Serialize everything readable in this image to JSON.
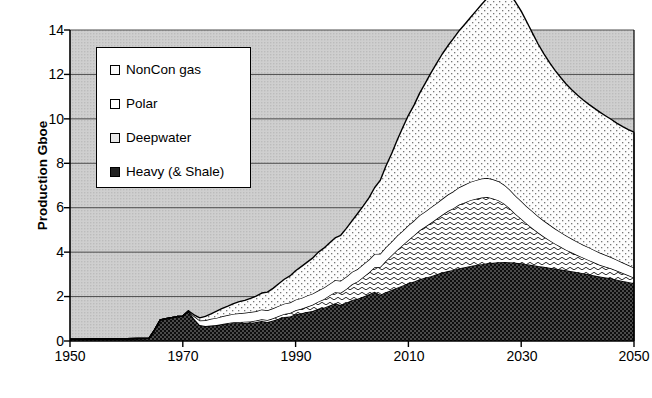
{
  "chart_data": {
    "type": "area",
    "stacked": true,
    "title": "",
    "xlabel": "",
    "ylabel": "Production Gboe",
    "xlim": [
      1950,
      2050
    ],
    "ylim": [
      0,
      14
    ],
    "xticks": [
      1950,
      1970,
      1990,
      2010,
      2030,
      2050
    ],
    "yticks": [
      0,
      2,
      4,
      6,
      8,
      10,
      12,
      14
    ],
    "grid": "horizontal",
    "legend_position": "upper-left-inside",
    "plot_background": "#c9c9c9",
    "x": [
      1950,
      1952,
      1954,
      1956,
      1958,
      1960,
      1962,
      1964,
      1965,
      1966,
      1967,
      1968,
      1969,
      1970,
      1971,
      1972,
      1973,
      1974,
      1975,
      1976,
      1977,
      1978,
      1979,
      1980,
      1981,
      1982,
      1983,
      1984,
      1985,
      1986,
      1987,
      1988,
      1989,
      1990,
      1991,
      1992,
      1993,
      1994,
      1995,
      1996,
      1997,
      1998,
      1999,
      2000,
      2001,
      2002,
      2003,
      2004,
      2005,
      2006,
      2007,
      2008,
      2009,
      2010,
      2011,
      2012,
      2013,
      2014,
      2015,
      2016,
      2017,
      2018,
      2019,
      2020,
      2021,
      2022,
      2023,
      2024,
      2025,
      2026,
      2027,
      2028,
      2029,
      2030,
      2031,
      2032,
      2033,
      2034,
      2035,
      2036,
      2037,
      2038,
      2039,
      2040,
      2041,
      2042,
      2043,
      2044,
      2045,
      2046,
      2047,
      2048,
      2049,
      2050
    ],
    "series": [
      {
        "name": "Heavy (& Shale)",
        "pattern": "dark-checker",
        "color": "#1a1a1a",
        "values": [
          0.08,
          0.08,
          0.09,
          0.09,
          0.1,
          0.1,
          0.11,
          0.12,
          0.5,
          0.95,
          1.0,
          1.05,
          1.1,
          1.12,
          1.35,
          1.0,
          0.72,
          0.68,
          0.7,
          0.72,
          0.75,
          0.78,
          0.8,
          0.8,
          0.82,
          0.82,
          0.85,
          0.9,
          0.85,
          0.92,
          1.0,
          1.08,
          1.1,
          1.2,
          1.25,
          1.3,
          1.35,
          1.45,
          1.5,
          1.6,
          1.7,
          1.62,
          1.72,
          1.85,
          1.9,
          2.0,
          2.1,
          2.22,
          2.08,
          2.2,
          2.3,
          2.4,
          2.5,
          2.6,
          2.68,
          2.78,
          2.85,
          2.92,
          3.0,
          3.08,
          3.15,
          3.2,
          3.28,
          3.32,
          3.38,
          3.42,
          3.46,
          3.5,
          3.52,
          3.55,
          3.56,
          3.55,
          3.52,
          3.5,
          3.46,
          3.42,
          3.38,
          3.34,
          3.3,
          3.26,
          3.22,
          3.18,
          3.14,
          3.1,
          3.05,
          3.0,
          2.95,
          2.9,
          2.86,
          2.82,
          2.76,
          2.7,
          2.66,
          2.6
        ]
      },
      {
        "name": "Deepwater",
        "pattern": "wave",
        "color": "#f2f2f2",
        "values": [
          0.0,
          0.0,
          0.0,
          0.0,
          0.0,
          0.0,
          0.0,
          0.0,
          0.0,
          0.0,
          0.0,
          0.0,
          0.0,
          0.0,
          0.0,
          0.0,
          0.0,
          0.0,
          0.0,
          0.0,
          0.02,
          0.03,
          0.04,
          0.05,
          0.05,
          0.06,
          0.07,
          0.08,
          0.09,
          0.1,
          0.12,
          0.14,
          0.16,
          0.18,
          0.2,
          0.24,
          0.28,
          0.32,
          0.38,
          0.45,
          0.5,
          0.55,
          0.62,
          0.7,
          0.78,
          0.88,
          0.98,
          1.1,
          1.25,
          1.4,
          1.55,
          1.7,
          1.82,
          1.95,
          2.08,
          2.2,
          2.3,
          2.4,
          2.5,
          2.6,
          2.7,
          2.78,
          2.86,
          2.92,
          2.96,
          2.98,
          3.0,
          2.98,
          2.9,
          2.78,
          2.62,
          2.42,
          2.2,
          2.0,
          1.82,
          1.66,
          1.5,
          1.36,
          1.24,
          1.12,
          1.02,
          0.92,
          0.84,
          0.76,
          0.7,
          0.64,
          0.58,
          0.52,
          0.48,
          0.44,
          0.4,
          0.36,
          0.3,
          0.25
        ]
      },
      {
        "name": "Polar",
        "pattern": "plain-white",
        "color": "#ffffff",
        "values": [
          0.0,
          0.0,
          0.0,
          0.0,
          0.0,
          0.0,
          0.0,
          0.0,
          0.0,
          0.0,
          0.0,
          0.0,
          0.0,
          0.0,
          0.0,
          0.12,
          0.2,
          0.25,
          0.3,
          0.32,
          0.34,
          0.36,
          0.38,
          0.4,
          0.4,
          0.42,
          0.42,
          0.44,
          0.44,
          0.45,
          0.46,
          0.46,
          0.47,
          0.48,
          0.48,
          0.5,
          0.5,
          0.5,
          0.52,
          0.52,
          0.54,
          0.54,
          0.55,
          0.56,
          0.56,
          0.58,
          0.58,
          0.6,
          0.6,
          0.62,
          0.62,
          0.64,
          0.64,
          0.66,
          0.66,
          0.68,
          0.68,
          0.7,
          0.7,
          0.72,
          0.74,
          0.76,
          0.78,
          0.8,
          0.82,
          0.84,
          0.85,
          0.86,
          0.86,
          0.86,
          0.85,
          0.84,
          0.82,
          0.8,
          0.78,
          0.76,
          0.74,
          0.72,
          0.7,
          0.68,
          0.66,
          0.64,
          0.62,
          0.6,
          0.58,
          0.57,
          0.56,
          0.55,
          0.53,
          0.51,
          0.49,
          0.47,
          0.46,
          0.45
        ]
      },
      {
        "name": "NonCon gas",
        "pattern": "fine-dot",
        "color": "#fafafa",
        "values": [
          0.0,
          0.0,
          0.0,
          0.0,
          0.0,
          0.0,
          0.0,
          0.0,
          0.0,
          0.0,
          0.0,
          0.0,
          0.0,
          0.0,
          0.0,
          0.06,
          0.12,
          0.18,
          0.22,
          0.3,
          0.36,
          0.4,
          0.46,
          0.52,
          0.56,
          0.62,
          0.68,
          0.74,
          0.82,
          0.9,
          1.0,
          1.1,
          1.2,
          1.3,
          1.42,
          1.5,
          1.6,
          1.72,
          1.78,
          1.84,
          1.9,
          2.05,
          2.18,
          2.3,
          2.5,
          2.62,
          2.78,
          2.98,
          3.3,
          3.65,
          3.95,
          4.3,
          4.65,
          4.95,
          5.2,
          5.5,
          5.78,
          6.05,
          6.3,
          6.52,
          6.7,
          6.88,
          7.05,
          7.22,
          7.4,
          7.62,
          7.85,
          8.1,
          8.35,
          8.55,
          8.7,
          8.8,
          8.72,
          8.55,
          8.3,
          8.02,
          7.75,
          7.52,
          7.3,
          7.12,
          6.96,
          6.82,
          6.7,
          6.6,
          6.52,
          6.44,
          6.38,
          6.32,
          6.26,
          6.2,
          6.15,
          6.12,
          6.1,
          6.1
        ]
      }
    ],
    "annotations": {
      "peak_total_value": 12.5,
      "peak_total_year": 2028,
      "end_total_value": 9.4,
      "end_total_year": 2050
    }
  },
  "legend": {
    "entries": [
      {
        "label": "NonCon gas"
      },
      {
        "label": "Polar"
      },
      {
        "label": "Deepwater"
      },
      {
        "label": "Heavy (& Shale)"
      }
    ]
  },
  "axes": {
    "y_title": "Production Gboe",
    "y_tick_labels": [
      "14",
      "12",
      "10",
      "8",
      "6",
      "4",
      "2",
      "0"
    ],
    "x_tick_labels": [
      "1950",
      "1970",
      "1990",
      "2010",
      "2030",
      "2050"
    ]
  }
}
